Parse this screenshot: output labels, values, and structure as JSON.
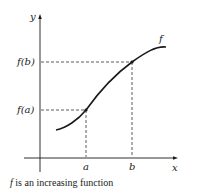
{
  "diagram": {
    "axes": {
      "x_label": "x",
      "y_label": "y"
    },
    "curve_label": "f",
    "points": [
      {
        "x_label": "a",
        "y_label": "f(a)"
      },
      {
        "x_label": "b",
        "y_label": "f(b)"
      }
    ],
    "caption": {
      "func": "f",
      "text": " is an increasing function"
    },
    "colors": {
      "line": "#1a1a1a",
      "dash": "#333333",
      "background": "#ffffff"
    }
  }
}
